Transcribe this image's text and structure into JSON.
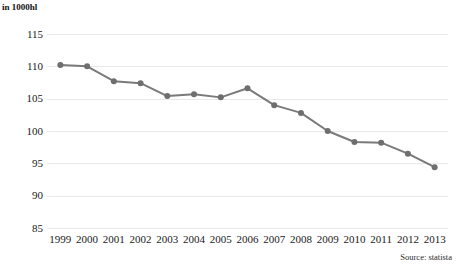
{
  "axis_title": "in 1000hl",
  "source_label": "Source: statista",
  "colors": {
    "line": "#7a7a7a",
    "marker": "#6e6e6e",
    "grid": "#e9e9e9",
    "text": "#1a1a1a",
    "background": "#ffffff"
  },
  "chart_data": {
    "type": "line",
    "title": "",
    "subtitle": "",
    "xlabel": "",
    "ylabel": "in 1000hl",
    "ylim": [
      85,
      115
    ],
    "ytick_values": [
      115,
      110,
      105,
      100,
      95,
      90,
      85
    ],
    "ytick_labels": [
      "115",
      "110",
      "105",
      "100",
      "95",
      "90",
      "85"
    ],
    "grid": true,
    "grid_axis": "y",
    "legend": false,
    "legend_position": "none",
    "markers": true,
    "categories": [
      "1999",
      "2000",
      "2001",
      "2002",
      "2003",
      "2004",
      "2005",
      "2006",
      "2007",
      "2008",
      "2009",
      "2010",
      "2011",
      "2012",
      "2013"
    ],
    "x": [
      1999,
      2000,
      2001,
      2002,
      2003,
      2004,
      2005,
      2006,
      2007,
      2008,
      2009,
      2010,
      2011,
      2012,
      2013
    ],
    "values": [
      110.2,
      110.0,
      107.7,
      107.4,
      105.4,
      105.7,
      105.2,
      106.6,
      104.0,
      102.8,
      100.0,
      98.3,
      98.2,
      96.5,
      94.4
    ],
    "series": [
      {
        "name": "in 1000hl",
        "values": [
          110.2,
          110.0,
          107.7,
          107.4,
          105.4,
          105.7,
          105.2,
          106.6,
          104.0,
          102.8,
          100.0,
          98.3,
          98.2,
          96.5,
          94.4
        ]
      }
    ]
  }
}
